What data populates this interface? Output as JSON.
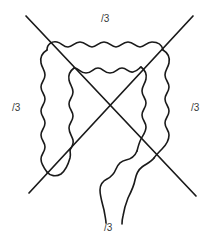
{
  "figure": {
    "stroke_color": "#1a1a1a",
    "background_color": "#ffffff",
    "stroke_width": 1.6
  },
  "labels": {
    "top": "/3",
    "left": "/3",
    "right": "/3",
    "bottom": "/3",
    "text_color": "#3a3a3a"
  },
  "annotations": {
    "diagonal_1": "top-left to bottom-right",
    "diagonal_2": "top-right to bottom-left",
    "crossing_point_x": 110,
    "crossing_point_y": 113
  }
}
